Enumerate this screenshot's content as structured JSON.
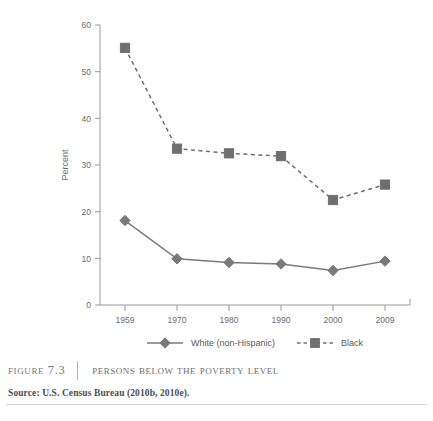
{
  "figure": {
    "number_label": "Figure 7.3",
    "title": "Persons below the Poverty Level",
    "source": "Source: U.S. Census Bureau (2010b, 2010e)."
  },
  "chart_data": {
    "type": "line",
    "title": "",
    "xlabel": "",
    "ylabel": "Percent",
    "categories": [
      "1959",
      "1970",
      "1980",
      "1990",
      "2000",
      "2009"
    ],
    "ylim": [
      0,
      60
    ],
    "yticks": [
      0,
      10,
      20,
      30,
      40,
      50,
      60
    ],
    "grid": false,
    "legend_position": "bottom",
    "series": [
      {
        "name": "White (non-Hispanic)",
        "values": [
          18.1,
          9.9,
          9.1,
          8.8,
          7.4,
          9.4
        ],
        "color": "#7a7a7a",
        "line_style": "solid",
        "marker": "diamond"
      },
      {
        "name": "Black",
        "values": [
          55.1,
          33.5,
          32.5,
          31.9,
          22.5,
          25.8
        ],
        "color": "#6f6f6f",
        "line_style": "dashed",
        "marker": "square"
      }
    ]
  },
  "legend": {
    "entries": [
      {
        "label": "White (non-Hispanic)"
      },
      {
        "label": "Black"
      }
    ]
  },
  "axis": {
    "y_tick_labels": [
      "0",
      "10",
      "20",
      "30",
      "40",
      "50",
      "60"
    ],
    "x_tick_labels": [
      "1959",
      "1970",
      "1980",
      "1990",
      "2000",
      "2009"
    ],
    "y_axis_title": "Percent"
  },
  "colors": {
    "axis": "#9a9a9a",
    "white_series": "#7a7a7a",
    "black_series": "#6f6f6f",
    "text": "#6b6b6b"
  }
}
